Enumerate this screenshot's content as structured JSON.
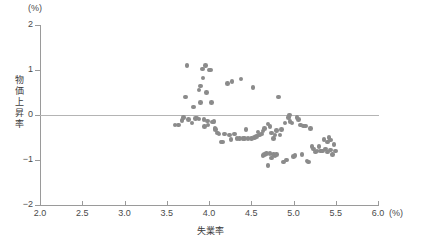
{
  "chart_data": {
    "type": "scatter",
    "title": "",
    "xlabel": "失業率",
    "ylabel": "物価上昇率",
    "x_unit": "(%)",
    "y_unit": "(%)",
    "xlim": [
      2.0,
      6.0
    ],
    "ylim": [
      -2,
      2
    ],
    "xticks": [
      "2.0",
      "2.5",
      "3.0",
      "3.5",
      "4.0",
      "4.5",
      "5.0",
      "5.5",
      "6.0"
    ],
    "xtick_values": [
      2.0,
      2.5,
      3.0,
      3.5,
      4.0,
      4.5,
      5.0,
      5.5,
      6.0
    ],
    "yticks": [
      "2",
      "1",
      "0",
      "−1",
      "−2"
    ],
    "ytick_values": [
      2,
      1,
      0,
      -1,
      -2
    ],
    "grid": false,
    "legend": false,
    "zero_line": true,
    "marker_color": "#8b8b8b",
    "axis_color": "#9a9a9a",
    "points": [
      [
        3.6,
        -0.22
      ],
      [
        3.64,
        -0.22
      ],
      [
        3.68,
        -0.12
      ],
      [
        3.7,
        -0.05
      ],
      [
        3.72,
        0.4
      ],
      [
        3.74,
        1.1
      ],
      [
        3.76,
        -0.1
      ],
      [
        3.8,
        -0.18
      ],
      [
        3.82,
        0.18
      ],
      [
        3.84,
        -0.08
      ],
      [
        3.86,
        -0.07
      ],
      [
        3.88,
        -0.09
      ],
      [
        3.88,
        0.56
      ],
      [
        3.9,
        0.64
      ],
      [
        3.9,
        0.28
      ],
      [
        3.92,
        1.02
      ],
      [
        3.93,
        0.82
      ],
      [
        3.94,
        -0.1
      ],
      [
        3.95,
        -0.26
      ],
      [
        3.96,
        1.1
      ],
      [
        3.97,
        0.5
      ],
      [
        3.98,
        -0.13
      ],
      [
        3.99,
        -0.22
      ],
      [
        4.0,
        1.0
      ],
      [
        4.02,
        1.0
      ],
      [
        4.03,
        0.28
      ],
      [
        4.04,
        -0.16
      ],
      [
        4.06,
        -0.14
      ],
      [
        4.07,
        -0.3
      ],
      [
        4.08,
        -0.32
      ],
      [
        4.1,
        -0.4
      ],
      [
        4.12,
        -0.42
      ],
      [
        4.14,
        -0.6
      ],
      [
        4.16,
        -0.6
      ],
      [
        4.18,
        -0.42
      ],
      [
        4.22,
        0.7
      ],
      [
        4.24,
        -0.44
      ],
      [
        4.26,
        -0.55
      ],
      [
        4.27,
        0.74
      ],
      [
        4.3,
        -0.42
      ],
      [
        4.33,
        -0.52
      ],
      [
        4.36,
        -0.52
      ],
      [
        4.38,
        0.8
      ],
      [
        4.4,
        -0.52
      ],
      [
        4.42,
        -0.52
      ],
      [
        4.44,
        -0.32
      ],
      [
        4.46,
        -0.52
      ],
      [
        4.5,
        -0.52
      ],
      [
        4.52,
        0.61
      ],
      [
        4.54,
        -0.5
      ],
      [
        4.56,
        -0.48
      ],
      [
        4.58,
        -0.38
      ],
      [
        4.6,
        -0.44
      ],
      [
        4.62,
        -0.42
      ],
      [
        4.64,
        -0.36
      ],
      [
        4.64,
        -0.9
      ],
      [
        4.66,
        -0.3
      ],
      [
        4.66,
        -0.88
      ],
      [
        4.68,
        -0.86
      ],
      [
        4.7,
        -0.2
      ],
      [
        4.7,
        -1.12
      ],
      [
        4.72,
        -0.26
      ],
      [
        4.72,
        -0.86
      ],
      [
        4.74,
        -0.4
      ],
      [
        4.74,
        -0.96
      ],
      [
        4.76,
        -0.52
      ],
      [
        4.76,
        -0.88
      ],
      [
        4.78,
        -0.44
      ],
      [
        4.78,
        -0.9
      ],
      [
        4.8,
        -0.34
      ],
      [
        4.8,
        -0.88
      ],
      [
        4.82,
        0.4
      ],
      [
        4.84,
        -0.44
      ],
      [
        4.86,
        -0.32
      ],
      [
        4.88,
        -1.04
      ],
      [
        4.9,
        -0.18
      ],
      [
        4.92,
        -1.0
      ],
      [
        4.94,
        -0.06
      ],
      [
        4.95,
        0.0
      ],
      [
        4.96,
        -0.14
      ],
      [
        4.98,
        -0.18
      ],
      [
        5.0,
        -0.92
      ],
      [
        5.02,
        -0.9
      ],
      [
        5.04,
        -0.06
      ],
      [
        5.06,
        -0.1
      ],
      [
        5.08,
        -0.22
      ],
      [
        5.1,
        -0.88
      ],
      [
        5.12,
        -0.24
      ],
      [
        5.14,
        -0.24
      ],
      [
        5.16,
        -1.02
      ],
      [
        5.18,
        -1.04
      ],
      [
        5.2,
        -0.3
      ],
      [
        5.22,
        -0.7
      ],
      [
        5.24,
        -0.76
      ],
      [
        5.26,
        -0.82
      ],
      [
        5.28,
        -0.8
      ],
      [
        5.3,
        -0.7
      ],
      [
        5.32,
        -0.8
      ],
      [
        5.34,
        -0.8
      ],
      [
        5.36,
        -0.54
      ],
      [
        5.38,
        -0.76
      ],
      [
        5.4,
        -0.6
      ],
      [
        5.4,
        -0.82
      ],
      [
        5.42,
        -0.5
      ],
      [
        5.44,
        -0.78
      ],
      [
        5.44,
        -0.56
      ],
      [
        5.46,
        -0.88
      ],
      [
        5.48,
        -0.66
      ],
      [
        5.5,
        -0.8
      ]
    ]
  }
}
